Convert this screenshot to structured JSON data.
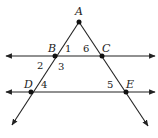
{
  "diagram": {
    "points": [
      {
        "name": "A",
        "x": 79,
        "y": 22
      },
      {
        "name": "B",
        "x": 55,
        "y": 56
      },
      {
        "name": "C",
        "x": 102,
        "y": 56
      },
      {
        "name": "D",
        "x": 31,
        "y": 92
      },
      {
        "name": "E",
        "x": 126,
        "y": 92
      }
    ],
    "point_labels": {
      "A": "A",
      "B": "B",
      "C": "C",
      "D": "D",
      "E": "E"
    },
    "angle_labels": {
      "a1": "1",
      "a2": "2",
      "a3": "3",
      "a4": "4",
      "a5": "5",
      "a6": "6"
    },
    "lines": [
      {
        "name": "line-BC",
        "description": "horizontal line through B and C with arrows both ends"
      },
      {
        "name": "line-DE",
        "description": "horizontal line through D and E with arrows both ends"
      },
      {
        "name": "ray-ABD",
        "description": "ray from A through B and D"
      },
      {
        "name": "ray-ACE",
        "description": "ray from A through C and E"
      }
    ],
    "colors": {
      "stroke": "#222222",
      "background": "#ffffff"
    }
  }
}
